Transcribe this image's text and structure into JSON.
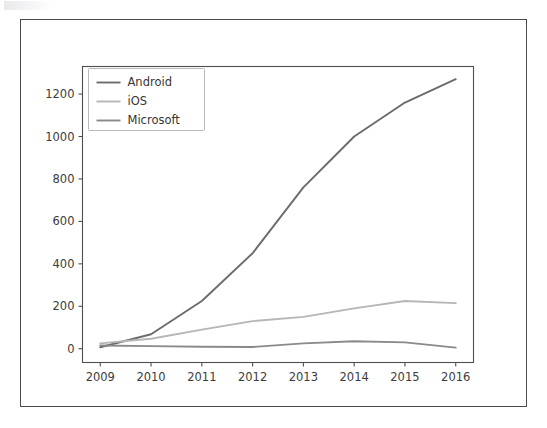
{
  "figure": {
    "background_color": "#ffffff",
    "border_color": "#4a4a4a"
  },
  "chart_data": {
    "type": "line",
    "title": "",
    "subtitle": "",
    "xlabel": "",
    "ylabel": "",
    "x": [
      2009,
      2010,
      2011,
      2012,
      2013,
      2014,
      2015,
      2016
    ],
    "categories": [
      "2009",
      "2010",
      "2011",
      "2012",
      "2013",
      "2014",
      "2015",
      "2016"
    ],
    "xlim": [
      2008.65,
      2016.35
    ],
    "ylim": [
      -65,
      1330
    ],
    "xticks": [
      2009,
      2010,
      2011,
      2012,
      2013,
      2014,
      2015,
      2016
    ],
    "xtick_labels": [
      "2009",
      "2010",
      "2011",
      "2012",
      "2013",
      "2014",
      "2015",
      "2016"
    ],
    "yticks": [
      0,
      200,
      400,
      600,
      800,
      1000,
      1200
    ],
    "ytick_labels": [
      "0",
      "200",
      "400",
      "600",
      "800",
      "1000",
      "1200"
    ],
    "grid": false,
    "legend_position": "upper left",
    "series": [
      {
        "name": "Android",
        "color": "#6b6b6b",
        "linewidth": 1.9,
        "values": [
          7,
          68,
          225,
          450,
          760,
          1000,
          1160,
          1270
        ]
      },
      {
        "name": "iOS",
        "color": "#b6b6b6",
        "linewidth": 1.9,
        "values": [
          25,
          47,
          90,
          130,
          150,
          190,
          225,
          215
        ]
      },
      {
        "name": "Microsoft",
        "color": "#8a8a8a",
        "linewidth": 1.9,
        "values": [
          15,
          12,
          9,
          8,
          25,
          35,
          30,
          5
        ]
      }
    ]
  },
  "legend": {
    "entries": [
      {
        "label": "Android",
        "color": "#6b6b6b"
      },
      {
        "label": "iOS",
        "color": "#b6b6b6"
      },
      {
        "label": "Microsoft",
        "color": "#8a8a8a"
      }
    ]
  }
}
